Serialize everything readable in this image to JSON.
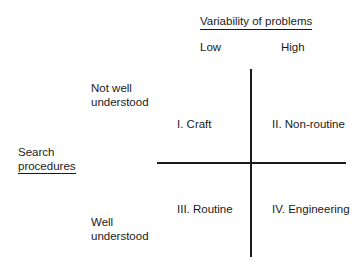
{
  "column_axis": {
    "title": "Variability of problems",
    "low_label": "Low",
    "high_label": "High"
  },
  "row_axis": {
    "title_line1": "Search",
    "title_line2": "procedures",
    "top_label_line1": "Not well",
    "top_label_line2": "understood",
    "bottom_label_line1": "Well",
    "bottom_label_line2": "understood"
  },
  "quadrants": [
    {
      "id": "I",
      "label": "I. Craft"
    },
    {
      "id": "II",
      "label": "II. Non-routine"
    },
    {
      "id": "III",
      "label": "III. Routine"
    },
    {
      "id": "IV",
      "label": "IV. Engineering"
    }
  ],
  "colors": {
    "line": "#1a1a1a",
    "text": "#1a1a1a",
    "background": "#ffffff"
  }
}
